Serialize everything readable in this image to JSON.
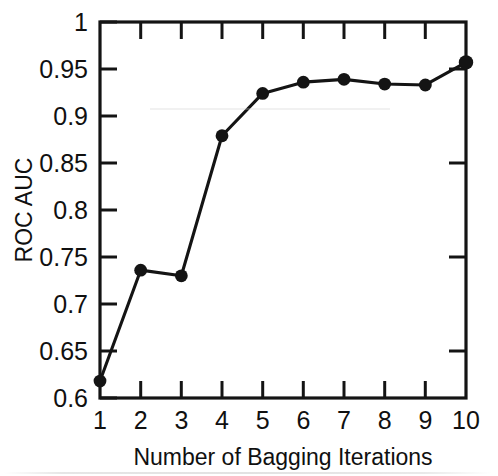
{
  "chart_data": {
    "type": "line",
    "title": "",
    "subtitle": "",
    "xlabel": "Number of Bagging Iterations",
    "ylabel": "ROC AUC",
    "x": [
      1,
      2,
      3,
      4,
      5,
      6,
      7,
      8,
      9,
      10
    ],
    "values": [
      0.618,
      0.736,
      0.73,
      0.879,
      0.924,
      0.936,
      0.939,
      0.934,
      0.933,
      0.957
    ],
    "series": [
      {
        "name": "ROC AUC",
        "values": [
          0.618,
          0.736,
          0.73,
          0.879,
          0.924,
          0.936,
          0.939,
          0.934,
          0.933,
          0.957
        ]
      }
    ],
    "xlim": [
      1,
      10
    ],
    "ylim": [
      0.6,
      1.0
    ],
    "xticks": [
      1,
      2,
      3,
      4,
      5,
      6,
      7,
      8,
      9,
      10
    ],
    "xtick_labels": [
      "1",
      "2",
      "3",
      "4",
      "5",
      "6",
      "7",
      "8",
      "9",
      "10"
    ],
    "yticks": [
      0.6,
      0.65,
      0.7,
      0.75,
      0.8,
      0.85,
      0.9,
      0.95,
      1.0
    ],
    "ytick_labels": [
      "0.6",
      "0.65",
      "0.7",
      "0.75",
      "0.8",
      "0.85",
      "0.9",
      "0.95",
      "1"
    ],
    "grid": false,
    "legend": "none",
    "marker": "filled-circle",
    "line_color": "#141414",
    "marker_color": "#141414",
    "background_color": "#ffffff",
    "ticks_direction": "inward-mirrored"
  },
  "axes": {
    "y_tick_labels": [
      "1",
      "0.95",
      "0.9",
      "0.85",
      "0.8",
      "0.75",
      "0.7",
      "0.65",
      "0.6"
    ],
    "x_tick_labels": [
      "1",
      "2",
      "3",
      "4",
      "5",
      "6",
      "7",
      "8",
      "9",
      "10"
    ],
    "y_axis_title": "ROC AUC",
    "x_axis_title": "Number of Bagging Iterations"
  }
}
